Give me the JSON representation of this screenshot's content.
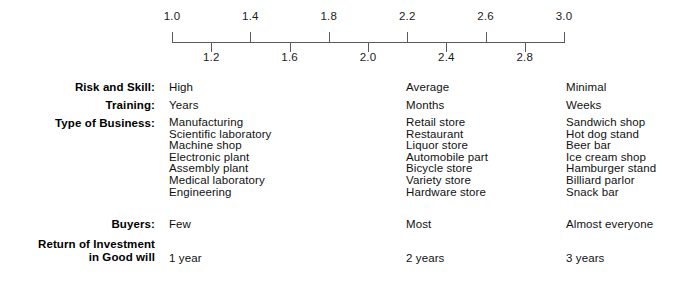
{
  "scale": {
    "axis": {
      "min": 1.0,
      "max": 3.0,
      "pixels_per_unit": 196
    },
    "major_ticks": [
      {
        "value": 1.0,
        "label": "1.0"
      },
      {
        "value": 1.4,
        "label": "1.4"
      },
      {
        "value": 1.8,
        "label": "1.8"
      },
      {
        "value": 2.2,
        "label": "2.2"
      },
      {
        "value": 2.6,
        "label": "2.6"
      },
      {
        "value": 3.0,
        "label": "3.0"
      }
    ],
    "minor_ticks": [
      {
        "value": 1.2,
        "label": "1.2"
      },
      {
        "value": 1.6,
        "label": "1.6"
      },
      {
        "value": 2.0,
        "label": "2.0"
      },
      {
        "value": 2.4,
        "label": "2.4"
      },
      {
        "value": 2.8,
        "label": "2.8"
      }
    ],
    "line_color": "#5a5a5a"
  },
  "rows": {
    "risk": {
      "label": "Risk and Skill:",
      "col1": "High",
      "col2": "Average",
      "col3": "Minimal"
    },
    "training": {
      "label": "Training:",
      "col1": "Years",
      "col2": "Months",
      "col3": "Weeks"
    },
    "type_of_business": {
      "label": "Type of Business:",
      "col1": [
        "Manufacturing",
        "Scientific laboratory",
        "Machine shop",
        "Electronic plant",
        "Assembly plant",
        "Medical laboratory",
        "Engineering"
      ],
      "col2": [
        "Retail store",
        "Restaurant",
        "Liquor store",
        "Automobile part",
        "Bicycle store",
        "Variety store",
        "Hardware store"
      ],
      "col3": [
        "Sandwich shop",
        "Hot dog stand",
        "Beer bar",
        "Ice cream shop",
        "Hamburger stand",
        "Billiard parlor",
        "Snack bar"
      ]
    },
    "buyers": {
      "label": "Buyers:",
      "col1": "Few",
      "col2": "Most",
      "col3": "Almost everyone"
    },
    "roi": {
      "label_line1": "Return of Investment",
      "label_line2": "in Good will",
      "col1": "1 year",
      "col2": "2 years",
      "col3": "3 years"
    }
  }
}
